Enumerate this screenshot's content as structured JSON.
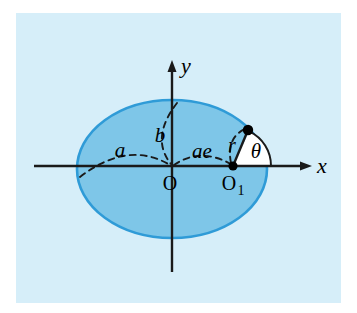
{
  "figure": {
    "panel_bg": "#d6eef9",
    "canvas_bg": "#ffffff"
  },
  "colors": {
    "panel_background": "#d6eef9",
    "ellipse_fill": "#7ec6e8",
    "ellipse_stroke": "#2f9bd7",
    "axis": "#1a1a1a",
    "dashed_guide": "#1a1a1a",
    "angle_wedge_fill": "#ffffff",
    "point_marker": "#000000",
    "label_text": "#000000"
  },
  "axes": {
    "x_label": "x",
    "y_label": "y",
    "origin_label": "O",
    "x_axis_y": 166,
    "y_axis_x": 172,
    "x_arrow_tip_x": 312,
    "y_arrow_tip_y": 60
  },
  "ellipse": {
    "center_x": 172,
    "center_y": 169,
    "semi_major_rx": 95,
    "semi_minor_ry": 69
  },
  "labels": {
    "semi_major": "a",
    "semi_minor": "b",
    "focal_distance": "ae",
    "radius": "r",
    "angle": "θ",
    "origin": "O",
    "focus": "O",
    "focus_subscript": "1",
    "x_axis": "x",
    "y_axis": "y"
  },
  "points": {
    "origin": {
      "name": "O",
      "x": 172,
      "y": 166
    },
    "focus": {
      "name": "O1",
      "x": 233,
      "y": 166
    },
    "ellipse_point": {
      "name": "P",
      "x": 248,
      "y": 130
    }
  },
  "measures": {
    "a_label_x": 120,
    "a_label_y": 152,
    "b_label_x": 160,
    "b_label_y": 135,
    "ae_label_x": 200,
    "ae_label_y": 152,
    "r_label_x": 233,
    "r_label_y": 146,
    "theta_label_x": 255,
    "theta_label_y": 152
  }
}
